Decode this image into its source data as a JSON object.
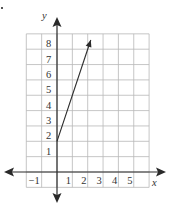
{
  "chart_data": {
    "type": "line",
    "title": "",
    "xlabel": "x",
    "ylabel": "y",
    "xlim": [
      -2,
      6
    ],
    "ylim": [
      -1,
      9
    ],
    "grid": true,
    "x_ticks": [
      -1,
      1,
      2,
      3,
      4,
      5
    ],
    "y_ticks": [
      1,
      2,
      3,
      4,
      5,
      6,
      7,
      8
    ],
    "x_tick_labels": [
      "−1",
      "1",
      "2",
      "3",
      "4",
      "5"
    ],
    "y_tick_labels": [
      "1",
      "2",
      "3",
      "4",
      "5",
      "6",
      "7",
      "8"
    ],
    "axes_arrows": true,
    "series": [
      {
        "name": "y = 3x + 2",
        "equation": "y = 3x + 2",
        "slope": 3,
        "intercept": 2,
        "start_point": [
          0,
          2
        ],
        "end_point": [
          2.2,
          8.6
        ],
        "start_style": "closed-endpoint",
        "end_style": "arrow",
        "x": [
          0,
          1,
          2,
          2.2
        ],
        "y": [
          2,
          5,
          8,
          8.6
        ],
        "color": "#2a2a2a"
      }
    ]
  },
  "labels": {
    "x_axis": "x",
    "y_axis": "y"
  },
  "colors": {
    "grid": "#b8b8b8",
    "axes": "#2a2a2a",
    "text": "#333333"
  }
}
